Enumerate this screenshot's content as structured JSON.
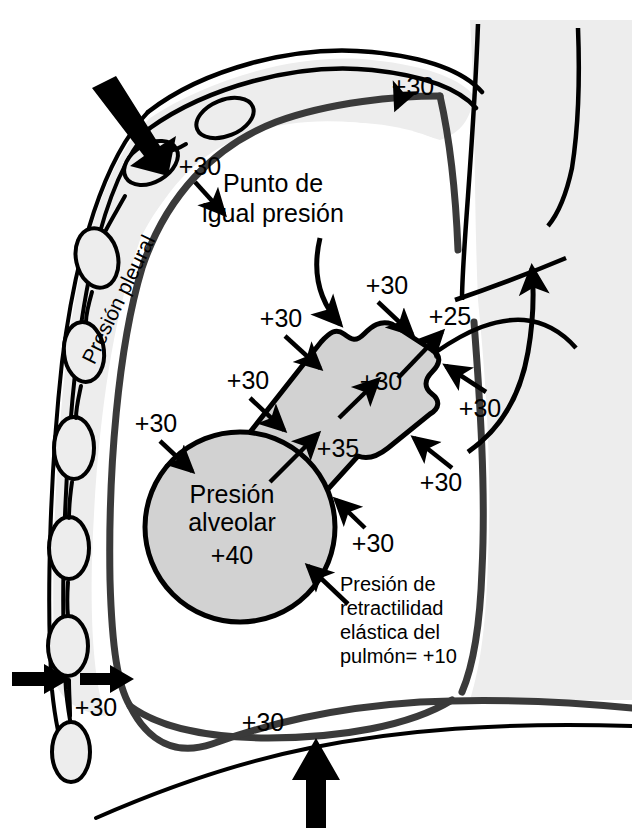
{
  "figure": {
    "title": "Punto de igual presión",
    "language": "es",
    "background_color": "#ffffff",
    "ink_color": "#000000",
    "colors": {
      "alveolus_fill": "#d2d2d2",
      "bronchus_fill": "#d2d2d2",
      "pleural_fill": "#ededed",
      "mediastinum_fill": "#ededed",
      "rib_fill": "#ededed",
      "outline": "#000000",
      "pleura_line": "#3a3a3a"
    }
  },
  "labels": {
    "equal_pressure_point": {
      "line1": "Punto de",
      "line2": "igual presión"
    },
    "pleural_pressure": "Presión pleural",
    "alveolar_pressure": {
      "line1": "Presión",
      "line2": "alveolar",
      "value": "+40"
    },
    "elastic_recoil": {
      "line1": "Presión de",
      "line2": "retractilidad",
      "line3": "elástica del",
      "line4": "pulmón= +10"
    }
  },
  "pressure_values": [
    {
      "id": "apex-pleural",
      "text": "+30",
      "x": 413,
      "y": 88,
      "region": "pleural space apex"
    },
    {
      "id": "upper-left-pleural",
      "text": "+30",
      "x": 200,
      "y": 168,
      "region": "pleural space upper left"
    },
    {
      "id": "airway-top-right",
      "text": "+30",
      "x": 387,
      "y": 287,
      "region": "pleural pressure on airway"
    },
    {
      "id": "airway-mid-left",
      "text": "+30",
      "x": 281,
      "y": 320,
      "region": "pleural pressure on airway"
    },
    {
      "id": "airway-lower-left",
      "text": "+30",
      "x": 248,
      "y": 382,
      "region": "pleural pressure on airway"
    },
    {
      "id": "alveolus-left",
      "text": "+30",
      "x": 156,
      "y": 425,
      "region": "pleural pressure on alveolus"
    },
    {
      "id": "mouthward-25",
      "text": "+25",
      "x": 450,
      "y": 318,
      "region": "intrabronchial downstream"
    },
    {
      "id": "bronchus-inner-30",
      "text": "+30",
      "x": 381,
      "y": 383,
      "region": "intrabronchial"
    },
    {
      "id": "bronchus-inner-35",
      "text": "+35",
      "x": 338,
      "y": 450,
      "region": "intrabronchial"
    },
    {
      "id": "right-upper-30",
      "text": "+30",
      "x": 480,
      "y": 410,
      "region": "pleural pressure right"
    },
    {
      "id": "right-lower-30",
      "text": "+30",
      "x": 441,
      "y": 484,
      "region": "pleural pressure right"
    },
    {
      "id": "below-bronchus-30",
      "text": "+30",
      "x": 373,
      "y": 545,
      "region": "pleural pressure lower"
    },
    {
      "id": "chestwall-left-30",
      "text": "+30",
      "x": 96,
      "y": 709,
      "region": "chest wall compression"
    },
    {
      "id": "diaphragm-30",
      "text": "+30",
      "x": 263,
      "y": 724,
      "region": "diaphragm"
    }
  ],
  "pointers": {
    "external_chest_force": "thick-arrow-inward",
    "chest_wall_squeeze": "thick-arrow-pair",
    "diaphragm_force": "thick-arrow-up",
    "airflow": "curved-arrow-up-trachea",
    "equal_pressure_leader": "curved-leader-arrow"
  }
}
